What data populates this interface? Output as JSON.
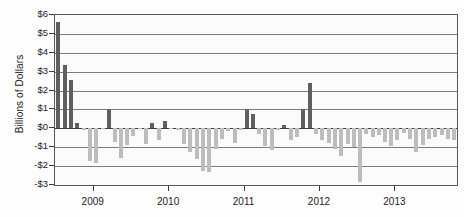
{
  "chart_data": {
    "type": "bar",
    "title": "",
    "xlabel": "",
    "ylabel": "Billions of Dollars",
    "ylim": [
      -3,
      6
    ],
    "y_tick_labels": [
      "$6",
      "$5",
      "$4",
      "$3",
      "$2",
      "$1",
      "$0",
      "-$1",
      "-$2",
      "-$3"
    ],
    "y_tick_values": [
      6,
      5,
      4,
      3,
      2,
      1,
      0,
      -1,
      -2,
      -3
    ],
    "x_tick_labels": [
      "2009",
      "2010",
      "2011",
      "2012",
      "2013"
    ],
    "x_tick_values": [
      2009,
      2010,
      2011,
      2012,
      2013
    ],
    "xlim": [
      2008.5,
      2013.83
    ],
    "grid": true,
    "legend": "none",
    "positive_color": "#5f5f5f",
    "negative_color": "#bdbdbd",
    "x": [
      2008.54,
      2008.63,
      2008.71,
      2008.79,
      2008.88,
      2008.96,
      2009.04,
      2009.13,
      2009.21,
      2009.29,
      2009.38,
      2009.46,
      2009.54,
      2009.63,
      2009.71,
      2009.79,
      2009.88,
      2009.96,
      2010.04,
      2010.13,
      2010.21,
      2010.29,
      2010.38,
      2010.46,
      2010.54,
      2010.63,
      2010.71,
      2010.79,
      2010.88,
      2010.96,
      2011.04,
      2011.13,
      2011.21,
      2011.29,
      2011.38,
      2011.46,
      2011.54,
      2011.63,
      2011.71,
      2011.79,
      2011.88,
      2011.96,
      2012.04,
      2012.13,
      2012.21,
      2012.29,
      2012.38,
      2012.46,
      2012.54,
      2012.63,
      2012.71,
      2012.79,
      2012.88,
      2012.96,
      2013.04,
      2013.13,
      2013.21,
      2013.29,
      2013.38,
      2013.46,
      2013.54,
      2013.63,
      2013.71,
      2013.79
    ],
    "values": [
      5.65,
      3.35,
      2.55,
      0.3,
      -0.1,
      -1.75,
      -1.85,
      -0.05,
      1.0,
      -0.7,
      -1.55,
      -0.9,
      -0.4,
      -0.05,
      -0.85,
      0.3,
      -0.6,
      0.4,
      -0.05,
      -0.1,
      -0.85,
      -1.25,
      -1.6,
      -2.25,
      -2.3,
      -1.1,
      -0.55,
      -0.15,
      -0.8,
      -0.1,
      1.05,
      0.75,
      -0.3,
      -0.95,
      -1.15,
      -0.1,
      0.2,
      -0.6,
      -0.45,
      1.0,
      2.4,
      -0.3,
      -0.6,
      -0.8,
      -1.1,
      -1.45,
      -0.85,
      -1.0,
      -2.85,
      -0.3,
      -0.45,
      -0.35,
      -0.7,
      -0.95,
      -0.6,
      -0.25,
      -0.55,
      -1.25,
      -0.9,
      -0.55,
      -0.45,
      -0.35,
      -0.55,
      -0.6
    ]
  }
}
